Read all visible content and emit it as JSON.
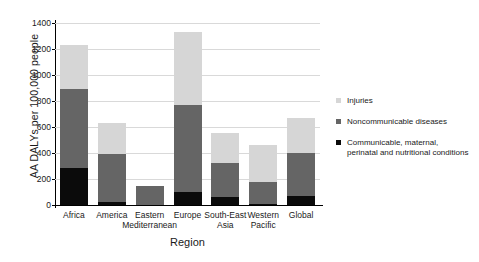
{
  "chart_data": {
    "type": "bar",
    "subtype": "stacked-vertical",
    "title": "",
    "xlabel": "Region",
    "ylabel": "AA DALYs per 100,000 people",
    "ylim": [
      0,
      1400
    ],
    "yticks": [
      0,
      200,
      400,
      600,
      800,
      1000,
      1200,
      1400
    ],
    "grid": true,
    "legend_position": "right",
    "categories": [
      "Africa",
      "America",
      "Eastern Mediterranean",
      "Europe",
      "South-East Asia",
      "Western Pacific",
      "Global"
    ],
    "category_lines": [
      [
        "Africa"
      ],
      [
        "America"
      ],
      [
        "Eastern",
        "Mediterranean"
      ],
      [
        "Europe"
      ],
      [
        "South-East",
        "Asia"
      ],
      [
        "Western",
        "Pacific"
      ],
      [
        "Global"
      ]
    ],
    "series": [
      {
        "name": "Communicable, maternal, perinatal and nutritional conditions",
        "name_lines": [
          "Communicable, maternal,",
          "perinatal and nutritional conditions"
        ],
        "color": "#0b0b0b",
        "values": [
          285,
          20,
          0,
          100,
          60,
          10,
          70
        ]
      },
      {
        "name": "Noncommunicable diseases",
        "name_lines": [
          "Noncommunicable diseases"
        ],
        "color": "#656565",
        "values": [
          610,
          375,
          150,
          670,
          265,
          170,
          330
        ]
      },
      {
        "name": "Injuries",
        "name_lines": [
          "Injuries"
        ],
        "color": "#d6d6d6",
        "values": [
          335,
          235,
          0,
          560,
          230,
          280,
          270
        ]
      }
    ],
    "totals": [
      1230,
      630,
      150,
      1330,
      555,
      460,
      670
    ]
  }
}
